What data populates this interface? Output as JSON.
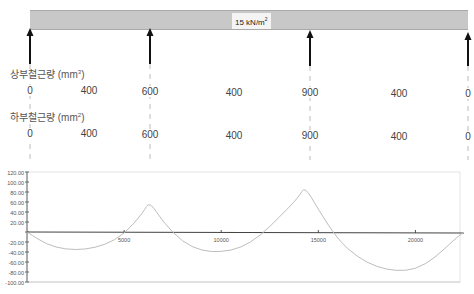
{
  "beam": {
    "load_label": "15 kN/m",
    "load_label_sup": "2",
    "fill_color": "#c8c8c8"
  },
  "supports": [
    {
      "x_px": 30
    },
    {
      "x_px": 150
    },
    {
      "x_px": 310
    },
    {
      "x_px": 468
    }
  ],
  "top_rebar": {
    "label": "상부철근량 (mm",
    "label_sup": "3",
    "label_close": ")",
    "values": [
      {
        "text": "0",
        "x": 30
      },
      {
        "text": "400",
        "x": 89
      },
      {
        "text": "600",
        "x": 150
      },
      {
        "text": "400",
        "x": 234
      },
      {
        "text": "900",
        "x": 310
      },
      {
        "text": "400",
        "x": 399
      },
      {
        "text": "0",
        "x": 468
      }
    ]
  },
  "bottom_rebar": {
    "label": "하부철근량 (mm",
    "label_sup": "2",
    "label_close": ")",
    "values": [
      {
        "text": "0",
        "x": 30
      },
      {
        "text": "400",
        "x": 89
      },
      {
        "text": "600",
        "x": 150
      },
      {
        "text": "400",
        "x": 234
      },
      {
        "text": "900",
        "x": 310
      },
      {
        "text": "400",
        "x": 399
      },
      {
        "text": "0",
        "x": 468
      }
    ]
  },
  "chart_data": {
    "type": "line",
    "title": "",
    "xlabel": "",
    "ylabel": "",
    "ylim": [
      -100,
      120
    ],
    "xlim": [
      0,
      22500
    ],
    "y_ticks": [
      "120.00",
      "100.00",
      "80.00",
      "60.00",
      "40.00",
      "20.00",
      "",
      "-20.00",
      "-40.00",
      "-60.00",
      "-80.00",
      "-100.00"
    ],
    "x_ticks": [
      "5000",
      "10000",
      "15000",
      "20000"
    ],
    "grid": false,
    "series": [
      {
        "name": "moment",
        "color": "#bdbdbd",
        "x": [
          0,
          1000,
          2000,
          3000,
          4000,
          5000,
          6000,
          6300,
          7000,
          8000,
          9000,
          10000,
          11000,
          12000,
          13000,
          14000,
          14300,
          15000,
          16000,
          17000,
          18000,
          19000,
          20000,
          21000,
          22000,
          22500
        ],
        "y": [
          0,
          -25,
          -35,
          -35,
          -26,
          -5,
          40,
          62,
          20,
          -20,
          -38,
          -40,
          -32,
          -8,
          30,
          70,
          92,
          45,
          -15,
          -50,
          -70,
          -78,
          -75,
          -52,
          -15,
          0
        ]
      }
    ]
  }
}
